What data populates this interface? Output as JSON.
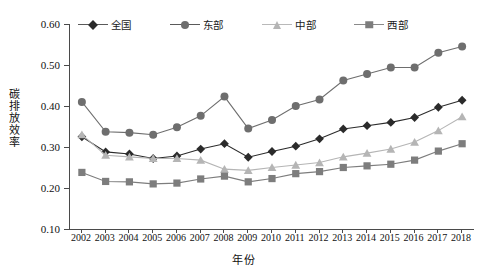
{
  "chart_data": {
    "type": "line",
    "title": "",
    "xlabel": "年份",
    "ylabel": "碳排放效率",
    "x": [
      2002,
      2003,
      2004,
      2005,
      2006,
      2007,
      2008,
      2009,
      2010,
      2011,
      2012,
      2013,
      2014,
      2015,
      2016,
      2017,
      2018
    ],
    "xtick_labels": [
      "2002",
      "2003",
      "2004",
      "2005",
      "2006",
      "2007",
      "2008",
      "2009",
      "2010",
      "2011",
      "2012",
      "2013",
      "2014",
      "2015",
      "2016",
      "2017",
      "2018"
    ],
    "ytick_labels": [
      "0.10",
      "0.20",
      "0.30",
      "0.40",
      "0.50",
      "0.60"
    ],
    "yticks": [
      0.1,
      0.2,
      0.3,
      0.4,
      0.5,
      0.6
    ],
    "ylim": [
      0.1,
      0.6
    ],
    "grid": false,
    "legend_position": "top",
    "series": [
      {
        "name": "全国",
        "marker": "diamond",
        "color": "#2b2b2b",
        "values": [
          0.325,
          0.288,
          0.283,
          0.272,
          0.278,
          0.295,
          0.308,
          0.275,
          0.289,
          0.302,
          0.32,
          0.344,
          0.352,
          0.36,
          0.372,
          0.397,
          0.414
        ]
      },
      {
        "name": "东部",
        "marker": "circle",
        "color": "#6e6e6e",
        "values": [
          0.41,
          0.337,
          0.335,
          0.33,
          0.348,
          0.376,
          0.423,
          0.345,
          0.366,
          0.4,
          0.416,
          0.462,
          0.478,
          0.494,
          0.494,
          0.53,
          0.545
        ]
      },
      {
        "name": "中部",
        "marker": "triangle",
        "color": "#b5b5b5",
        "values": [
          0.33,
          0.28,
          0.276,
          0.272,
          0.272,
          0.268,
          0.246,
          0.243,
          0.25,
          0.256,
          0.262,
          0.276,
          0.285,
          0.295,
          0.312,
          0.34,
          0.374
        ]
      },
      {
        "name": "西部",
        "marker": "square",
        "color": "#7d7d7d",
        "values": [
          0.238,
          0.216,
          0.215,
          0.21,
          0.212,
          0.222,
          0.229,
          0.215,
          0.223,
          0.235,
          0.24,
          0.25,
          0.254,
          0.258,
          0.268,
          0.29,
          0.308
        ]
      }
    ]
  }
}
